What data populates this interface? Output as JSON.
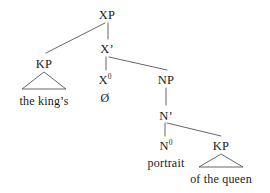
{
  "diagram": {
    "type": "syntax-tree",
    "stroke_color": "#55555a",
    "text_color": "#1b1b1b",
    "background_color": "#ffffff"
  },
  "nodes": {
    "xp": {
      "label": "XP",
      "x": 107,
      "y": 9
    },
    "kp_left": {
      "label": "KP",
      "x": 44,
      "y": 58
    },
    "xbar": {
      "label": "X’",
      "x": 107,
      "y": 43
    },
    "x0": {
      "label": "X",
      "sup": "0",
      "x": 105,
      "y": 74
    },
    "null_head": {
      "label": "Ø",
      "x": 105,
      "y": 92
    },
    "np": {
      "label": "NP",
      "x": 166,
      "y": 74
    },
    "nbar": {
      "label": "N’",
      "x": 166,
      "y": 110
    },
    "n0": {
      "label": "N",
      "sup": "0",
      "x": 166,
      "y": 140
    },
    "portrait": {
      "label": "portrait",
      "x": 166,
      "y": 157
    },
    "kp_right": {
      "label": "KP",
      "x": 221,
      "y": 140
    },
    "the_kings": {
      "label": "the king’s",
      "x": 44,
      "y": 95
    },
    "of_the_queen": {
      "label": "of the queen",
      "x": 221,
      "y": 173
    }
  },
  "edges": [
    {
      "name": "xp-to-kp-left",
      "x1": 105,
      "y1": 23,
      "x2": 46,
      "y2": 53
    },
    {
      "name": "xp-to-xbar",
      "x1": 108,
      "y1": 23,
      "x2": 108,
      "y2": 39
    },
    {
      "name": "xbar-to-x0",
      "x1": 106,
      "y1": 57,
      "x2": 106,
      "y2": 70
    },
    {
      "name": "xbar-to-np",
      "x1": 109,
      "y1": 57,
      "x2": 167,
      "y2": 70
    },
    {
      "name": "np-to-nbar",
      "x1": 166,
      "y1": 88,
      "x2": 166,
      "y2": 105
    },
    {
      "name": "nbar-to-n0",
      "x1": 165,
      "y1": 123,
      "x2": 165,
      "y2": 136
    },
    {
      "name": "nbar-to-kp-right",
      "x1": 167,
      "y1": 123,
      "x2": 221,
      "y2": 136
    }
  ],
  "triangles": [
    {
      "name": "kp-left-triangle",
      "apex_x": 44,
      "apex_y": 72,
      "left_x": 22,
      "right_x": 66,
      "base_y": 89
    },
    {
      "name": "kp-right-triangle",
      "apex_x": 221,
      "apex_y": 154,
      "left_x": 199,
      "right_x": 243,
      "base_y": 167
    }
  ],
  "tree_structure": {
    "root": "XP",
    "description": "XP branches into KP (the king’s) and X’; X’ branches into X⁰ (Ø) and NP; NP dominates N’; N’ branches into N⁰ (portrait) and KP (of the queen)"
  }
}
